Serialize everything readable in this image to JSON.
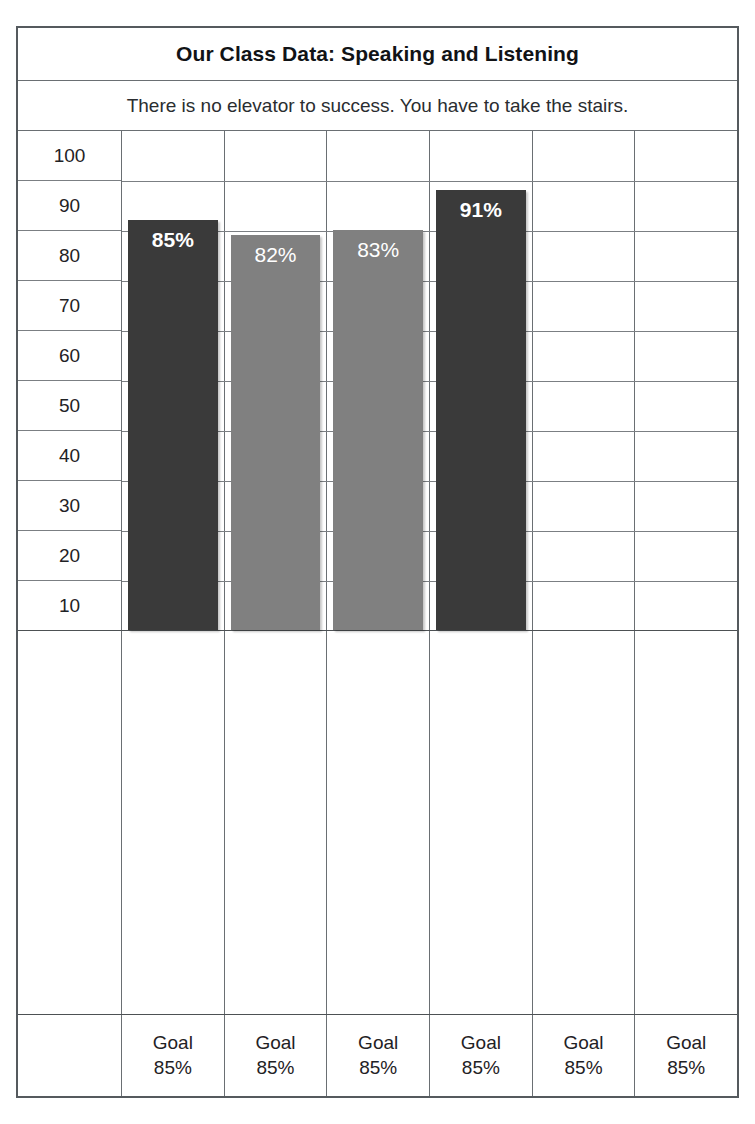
{
  "header": {
    "title": "Our Class Data: Speaking and Listening",
    "subtitle": "There is no elevator to success. You have to take the stairs."
  },
  "row_label": "I can . . .",
  "goal_label": "Goal",
  "goal_value": "85%",
  "colors": {
    "bar_dark": "#3a3a3a",
    "bar_light": "#808080",
    "grid": "#7b7f83",
    "border": "#555a5e",
    "text": "#1f2225",
    "bar_text": "#ffffff"
  },
  "chart_data": {
    "type": "bar",
    "title": "Our Class Data: Speaking and Listening",
    "subtitle": "There is no elevator to success. You have to take the stairs.",
    "xlabel": "I can . . .",
    "ylabel": "",
    "ylim": [
      0,
      100
    ],
    "yticks": [
      100,
      90,
      80,
      70,
      60,
      50,
      40,
      30,
      20,
      10
    ],
    "grid": true,
    "legend": "none",
    "goal_line": 85,
    "categories": [
      "Prepare for discussions by reading required material",
      "Follow class discussion rules",
      "Explain my own ideas and understanding about a topic",
      "Tell the main idea of a text read aloud",
      "Tell the supporting details of a text read aloud",
      "Ask and answer questions about information from a speaker"
    ],
    "values": [
      85,
      82,
      83,
      91,
      null,
      null
    ],
    "value_labels": [
      "85%",
      "82%",
      "83%",
      "91%",
      "",
      ""
    ],
    "bar_styles": [
      "dark",
      "light",
      "light",
      "dark",
      "none",
      "none"
    ],
    "goals": [
      "85%",
      "85%",
      "85%",
      "85%",
      "85%",
      "85%"
    ]
  }
}
